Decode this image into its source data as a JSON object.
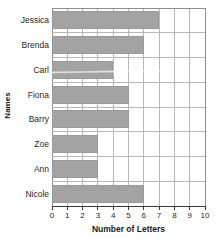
{
  "chart_data": {
    "type": "bar",
    "orientation": "horizontal",
    "title": "",
    "xlabel": "Number of Letters",
    "ylabel": "Names",
    "categories": [
      "Jessica",
      "Brenda",
      "Carl",
      "Fiona",
      "Barry",
      "Zoe",
      "Ann",
      "Nicole"
    ],
    "values": [
      7,
      6,
      4,
      5,
      5,
      3,
      3,
      6
    ],
    "xlim": [
      0,
      10
    ],
    "xticks": [
      0,
      1,
      2,
      3,
      4,
      5,
      6,
      7,
      8,
      9,
      10
    ],
    "xtick_labels": [
      "0",
      "1",
      "2",
      "3",
      "4",
      "5",
      "6",
      "7",
      "8",
      "9",
      "10"
    ],
    "grid": true,
    "legend": "none",
    "bar_color": "#a3a3a3",
    "grid_color": "#b8b8b8",
    "axis_color": "#3a3a3a",
    "background_color": "#ffffff"
  }
}
